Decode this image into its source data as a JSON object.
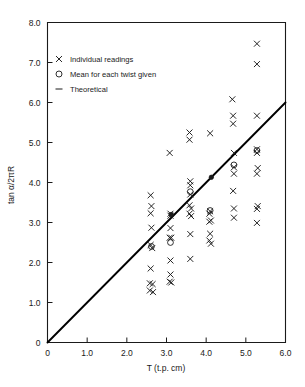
{
  "chart_data": {
    "type": "scatter",
    "title": "",
    "xlabel": "T (t.p. cm)",
    "ylabel": "tan α/2πR",
    "xlim": [
      0,
      6.0
    ],
    "ylim": [
      0,
      8.0
    ],
    "xticks": [
      "0",
      "1.0",
      "2.0",
      "3.0",
      "4.0",
      "5.0",
      "6.0"
    ],
    "xtick_values": [
      0,
      1.0,
      2.0,
      3.0,
      4.0,
      5.0,
      6.0
    ],
    "yticks": [
      "0",
      "1.0",
      "2.0",
      "3.0",
      "4.0",
      "5.0",
      "6.0",
      "7.0",
      "8.0"
    ],
    "ytick_values": [
      0,
      1.0,
      2.0,
      3.0,
      4.0,
      5.0,
      6.0,
      7.0,
      8.0
    ],
    "grid": false,
    "legend_position": "upper-left",
    "legend": [
      {
        "marker": "cross",
        "label": "Individual readings"
      },
      {
        "marker": "circle",
        "label": "Mean for each twist given"
      },
      {
        "marker": "dash",
        "label": "Theoretical"
      }
    ],
    "series": [
      {
        "name": "Individual readings",
        "marker": "cross",
        "points": [
          [
            2.6,
            3.68
          ],
          [
            2.62,
            3.41
          ],
          [
            2.6,
            3.23
          ],
          [
            2.62,
            2.87
          ],
          [
            2.6,
            2.44
          ],
          [
            2.64,
            2.36
          ],
          [
            2.6,
            1.85
          ],
          [
            2.58,
            1.48
          ],
          [
            2.65,
            1.46
          ],
          [
            2.58,
            1.3
          ],
          [
            2.66,
            1.26
          ],
          [
            3.08,
            4.74
          ],
          [
            3.1,
            3.22
          ],
          [
            3.1,
            3.17
          ],
          [
            3.1,
            2.86
          ],
          [
            3.08,
            2.62
          ],
          [
            3.12,
            2.62
          ],
          [
            3.1,
            2.05
          ],
          [
            3.1,
            1.7
          ],
          [
            3.08,
            1.52
          ],
          [
            3.12,
            1.5
          ],
          [
            3.58,
            5.25
          ],
          [
            3.58,
            5.07
          ],
          [
            3.6,
            4.03
          ],
          [
            3.6,
            3.93
          ],
          [
            3.6,
            3.7
          ],
          [
            3.58,
            3.43
          ],
          [
            3.62,
            3.35
          ],
          [
            3.58,
            3.22
          ],
          [
            3.62,
            3.16
          ],
          [
            3.6,
            2.71
          ],
          [
            3.6,
            2.09
          ],
          [
            4.1,
            5.23
          ],
          [
            4.1,
            3.28
          ],
          [
            4.08,
            3.22
          ],
          [
            4.12,
            3.05
          ],
          [
            4.08,
            3.02
          ],
          [
            4.1,
            2.72
          ],
          [
            4.08,
            2.55
          ],
          [
            4.12,
            2.47
          ],
          [
            4.66,
            6.08
          ],
          [
            4.68,
            5.67
          ],
          [
            4.68,
            5.47
          ],
          [
            4.7,
            4.74
          ],
          [
            4.7,
            4.38
          ],
          [
            4.7,
            4.22
          ],
          [
            4.68,
            3.79
          ],
          [
            4.7,
            3.35
          ],
          [
            4.7,
            3.12
          ],
          [
            5.28,
            7.47
          ],
          [
            5.28,
            6.96
          ],
          [
            5.28,
            5.67
          ],
          [
            5.28,
            4.83
          ],
          [
            5.28,
            4.74
          ],
          [
            5.3,
            4.36
          ],
          [
            5.28,
            4.22
          ],
          [
            5.3,
            3.41
          ],
          [
            5.28,
            3.34
          ],
          [
            5.28,
            2.99
          ]
        ]
      },
      {
        "name": "Mean for each twist given",
        "marker": "circle",
        "points": [
          [
            2.62,
            2.4
          ],
          [
            3.1,
            2.5
          ],
          [
            3.6,
            3.77
          ],
          [
            4.1,
            3.3
          ],
          [
            4.7,
            4.44
          ],
          [
            5.28,
            4.8
          ]
        ]
      },
      {
        "name": "Mean on theoretical line",
        "marker": "filled",
        "points": [
          [
            3.12,
            3.2
          ],
          [
            4.13,
            4.13
          ]
        ]
      }
    ],
    "theoretical_line": {
      "name": "Theoretical",
      "type": "line",
      "equation": "y = x",
      "from": [
        0,
        0
      ],
      "to": [
        6.0,
        6.0
      ]
    }
  }
}
